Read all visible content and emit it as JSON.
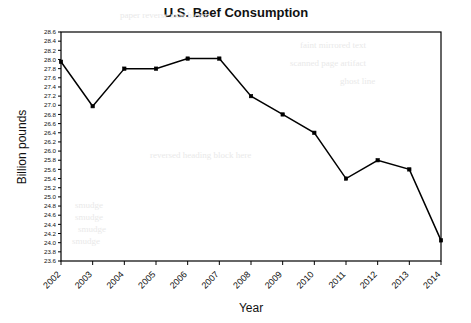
{
  "chart_data": {
    "type": "line",
    "title": "U.S. Beef Consumption",
    "xlabel": "Year",
    "ylabel": "Billion pounds",
    "categories": [
      "2002",
      "2003",
      "2004",
      "2005",
      "2006",
      "2007",
      "2008",
      "2009",
      "2010",
      "2011",
      "2012",
      "2013",
      "2014"
    ],
    "values": [
      27.95,
      26.98,
      27.8,
      27.8,
      28.02,
      28.02,
      27.2,
      26.8,
      26.4,
      25.4,
      25.8,
      25.6,
      24.05
    ],
    "series": [
      {
        "name": "U.S. Beef Consumption",
        "values": [
          27.95,
          26.98,
          27.8,
          27.8,
          28.02,
          28.02,
          27.2,
          26.8,
          26.4,
          25.4,
          25.8,
          25.6,
          24.05
        ]
      }
    ],
    "ylim": [
      23.6,
      28.6
    ],
    "ytick_step": 0.2,
    "ytick_labels": [
      "28.6",
      "28.4",
      "28.2",
      "28.0",
      "27.8",
      "27.6",
      "27.4",
      "27.2",
      "27.0",
      "26.8",
      "26.6",
      "26.4",
      "26.2",
      "26.0",
      "25.8",
      "25.6",
      "25.4",
      "25.2",
      "25.0",
      "24.8",
      "24.6",
      "24.4",
      "24.2",
      "24.0",
      "23.8",
      "23.6"
    ],
    "xtick_rotation_deg": -45,
    "grid": false,
    "legend": "none",
    "marker": "filled-square",
    "line_color": "#000000",
    "marker_color": "#000000",
    "background_color": "#ffffff"
  },
  "background_bleed": [
    {
      "text": "paper reverse side bleed",
      "x": 120,
      "y": 10
    },
    {
      "text": "faint mirrored text",
      "x": 300,
      "y": 40
    },
    {
      "text": "scanned page artifact",
      "x": 290,
      "y": 58
    },
    {
      "text": "ghost line",
      "x": 340,
      "y": 76
    },
    {
      "text": "reversed heading block here",
      "x": 150,
      "y": 150
    },
    {
      "text": "smudge",
      "x": 75,
      "y": 200
    },
    {
      "text": "smudge",
      "x": 75,
      "y": 212
    },
    {
      "text": "smudge",
      "x": 78,
      "y": 224
    },
    {
      "text": "smudge",
      "x": 72,
      "y": 236
    }
  ]
}
